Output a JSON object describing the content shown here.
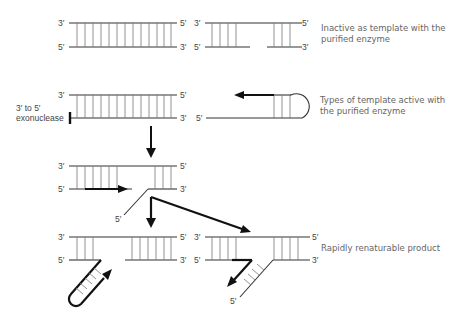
{
  "figure": {
    "primes": {
      "three": "3′",
      "five": "5′"
    },
    "captions": {
      "inactive_line1": "Inactive as template with the",
      "inactive_line2": "purified enzyme",
      "active_line1": "Types of template active with",
      "active_line2": "the purified enzyme",
      "exonuclease_line1": "3′ to 5′",
      "exonuclease_line2": "exonuclease",
      "product": "Rapidly renaturable product"
    },
    "colors": {
      "strand": "#333333",
      "rung": "#777777",
      "arrow": "#111111",
      "caption": "#666666"
    }
  }
}
